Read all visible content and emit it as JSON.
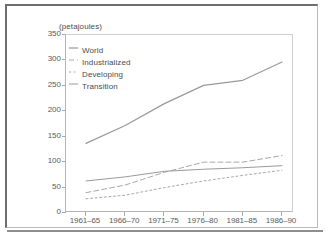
{
  "figure": {
    "axis_title": "(petajoules)"
  },
  "chart_data": {
    "type": "line",
    "title": "",
    "subtitle": "",
    "xlabel": "",
    "ylabel": "(petajoules)",
    "units": "petajoules",
    "grid": false,
    "legend_position": "top-left-inside",
    "categories": [
      "1961–65",
      "1966–70",
      "1971–75",
      "1976–80",
      "1981–85",
      "1986–90"
    ],
    "xtick_labels": [
      "1961–65",
      "1966–70",
      "1971–75",
      "1976–80",
      "1981–85",
      "1986–90"
    ],
    "ytick_labels": [
      "0",
      "50",
      "100",
      "150",
      "200",
      "250",
      "300",
      "350"
    ],
    "ytick_values": [
      0,
      50,
      100,
      150,
      200,
      250,
      300,
      350
    ],
    "ylim": [
      0,
      350
    ],
    "series": [
      {
        "name": "World",
        "style": "solid",
        "color": "#9a9a9a",
        "values": [
          137,
          172,
          215,
          251,
          261,
          297
        ]
      },
      {
        "name": "Industrialized",
        "style": "dashed",
        "color": "#a8a8a8",
        "values": [
          40,
          55,
          80,
          100,
          100,
          113
        ]
      },
      {
        "name": "Developing",
        "style": "dotted",
        "color": "#a8a8a8",
        "values": [
          28,
          35,
          50,
          63,
          74,
          84
        ]
      },
      {
        "name": "Transition",
        "style": "solid-thin",
        "color": "#9a9a9a",
        "values": [
          63,
          71,
          82,
          86,
          89,
          93
        ]
      }
    ]
  },
  "legend": {
    "items": [
      {
        "label": "World"
      },
      {
        "label": "Industrialized"
      },
      {
        "label": "Developing"
      },
      {
        "label": "Transition"
      }
    ]
  }
}
